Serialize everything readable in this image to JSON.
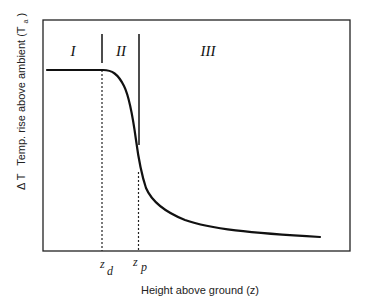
{
  "diagram": {
    "type": "schematic-curve",
    "regions": [
      {
        "id": "I",
        "label": "I"
      },
      {
        "id": "II",
        "label": "II"
      },
      {
        "id": "III",
        "label": "III"
      }
    ],
    "markers": [
      {
        "id": "zd",
        "symbol": "z",
        "subscript": "d"
      },
      {
        "id": "zp",
        "symbol": "z",
        "subscript": "p"
      }
    ],
    "x_axis_label": "Height above ground (z)",
    "y_axis_label": {
      "prefix": "Δ T",
      "text": "Temp. rise above ambient (T",
      "subscript": "a",
      "suffix": ")"
    },
    "colors": {
      "line": "#111111",
      "frame": "#222222",
      "background": "#ffffff"
    }
  }
}
